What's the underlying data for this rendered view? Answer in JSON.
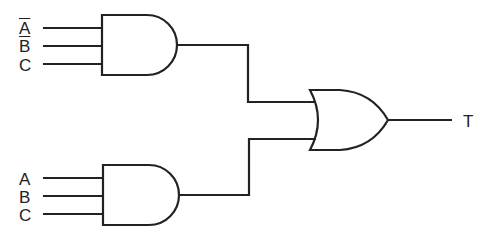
{
  "diagram": {
    "type": "logic-circuit",
    "gates": [
      {
        "id": "and1",
        "type": "AND",
        "inputs": [
          "A̅",
          "B̅",
          "C"
        ]
      },
      {
        "id": "and2",
        "type": "AND",
        "inputs": [
          "A",
          "B",
          "C"
        ]
      },
      {
        "id": "or1",
        "type": "OR",
        "inputs": [
          "and1",
          "and2"
        ],
        "output": "T"
      }
    ]
  },
  "labels": {
    "and1_in1": "A",
    "and1_in2": "B",
    "and1_in3": "C",
    "and2_in1": "A",
    "and2_in2": "B",
    "and2_in3": "C",
    "output": "T"
  },
  "colors": {
    "stroke": "#222222",
    "background": "#ffffff"
  }
}
